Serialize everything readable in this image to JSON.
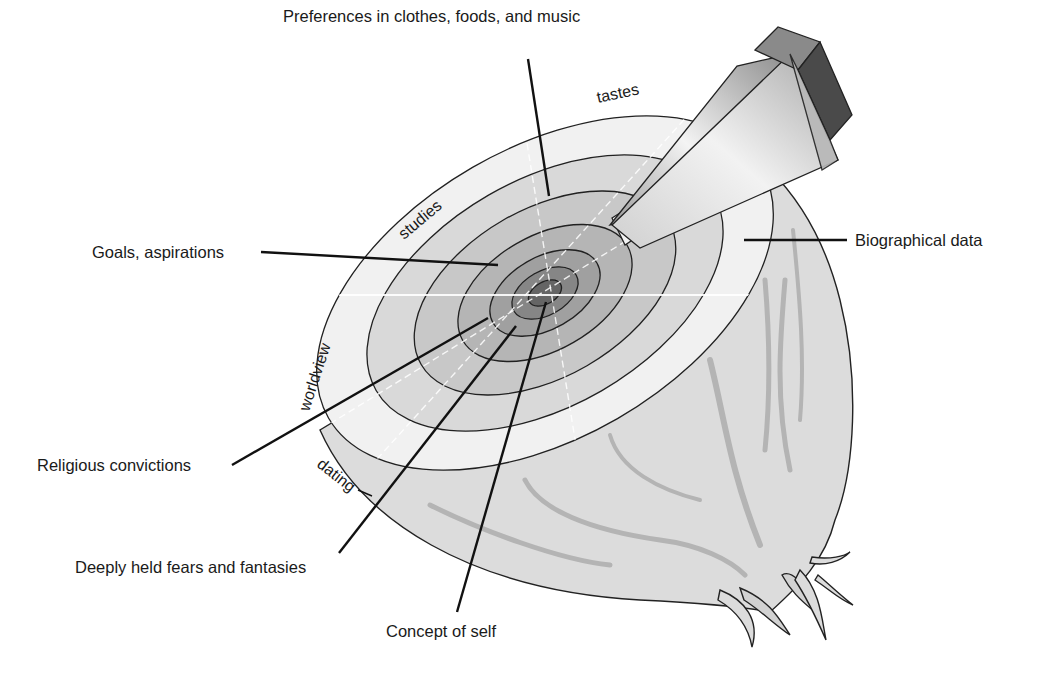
{
  "diagram": {
    "type": "layered onion (social penetration model)",
    "callouts": {
      "preferences": "Preferences in clothes, foods, and music",
      "goals": "Goals, aspirations",
      "biographical": "Biographical data",
      "religious": "Religious convictions",
      "fears": "Deeply held fears and fantasies",
      "self": "Concept of self"
    },
    "breadth_labels": {
      "tastes": "tastes",
      "studies": "studies",
      "worldview": "worldview",
      "dating": "dating"
    },
    "layers_outer_to_inner": [
      "Biographical data",
      "Preferences in clothes, foods, and music",
      "Goals, aspirations",
      "Religious convictions",
      "Deeply held fears and fantasies",
      "Concept of self"
    ],
    "colors": {
      "outer_ring": "#f1f1f1",
      "ring_2": "#d9d9d9",
      "ring_3": "#c6c6c6",
      "ring_4": "#b3b3b3",
      "ring_5": "#9c9c9c",
      "ring_6": "#7f7f7f",
      "core": "#5e5e5e",
      "onion_body": "#dcdcdc",
      "wedge_light": "#e6e6e6",
      "wedge_dark": "#4a4a4a"
    }
  }
}
